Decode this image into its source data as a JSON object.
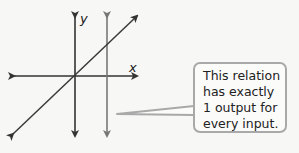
{
  "diagram": {
    "axes": {
      "x_label": "x",
      "y_label": "y"
    },
    "lines": [
      {
        "name": "diagonal-line",
        "color": "#3a3a3a"
      },
      {
        "name": "vertical-line",
        "color": "#7a7a7a"
      }
    ],
    "callout": {
      "lines": [
        "This relation",
        "has exactly",
        "1 output for",
        "every input."
      ],
      "border_color": "#a9a9a9"
    }
  }
}
